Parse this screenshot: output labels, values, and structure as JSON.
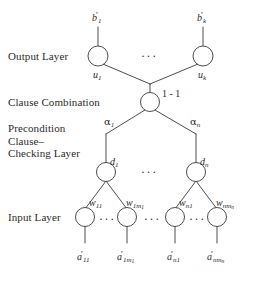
{
  "figure": {
    "type": "neural-network-architecture-diagram",
    "background_color": "#ffffff",
    "stroke_color": "#3a3a3a",
    "text_color": "#2b2b2b"
  },
  "layer_labels": {
    "output": "Output Layer",
    "clause_combination": "Clause Combination",
    "precondition": "Precondition\nClause–\nChecking Layer",
    "input": "Input Layer"
  },
  "output_layer": {
    "nodes": [
      {
        "id": "o1",
        "top_label": "b",
        "top_prime": "′",
        "top_sub": "1",
        "edge_label": "u",
        "edge_sub": "1"
      },
      {
        "id": "ok",
        "top_label": "b",
        "top_prime": "′",
        "top_sub": "k",
        "edge_label": "u",
        "edge_sub": "k"
      }
    ],
    "ellipsis": "···"
  },
  "combination_layer": {
    "node_label": "1 - 1",
    "edges": [
      {
        "label": "α",
        "sub": "1"
      },
      {
        "label": "α",
        "sub": "n"
      }
    ]
  },
  "precondition_layer": {
    "nodes": [
      {
        "id": "d1",
        "label": "d",
        "sub": "1"
      },
      {
        "id": "dn",
        "label": "d",
        "sub": "n"
      }
    ],
    "ellipsis": "···"
  },
  "input_layer": {
    "weights": [
      {
        "label": "w",
        "sub": "11",
        "sub2": ""
      },
      {
        "label": "w",
        "sub": "1m",
        "sub2": "1"
      },
      {
        "label": "w",
        "sub": "n1",
        "sub2": ""
      },
      {
        "label": "w",
        "sub": "nm",
        "sub2": "n"
      }
    ],
    "inputs": [
      {
        "label": "a",
        "prime": "′",
        "sub": "11",
        "sub2": ""
      },
      {
        "label": "a",
        "prime": "′",
        "sub": "1m",
        "sub2": "1"
      },
      {
        "label": "a",
        "prime": "′",
        "sub": "n1",
        "sub2": ""
      },
      {
        "label": "a",
        "prime": "′",
        "sub": "nm",
        "sub2": "n"
      }
    ],
    "group_ellipsis": "···",
    "middle_ellipsis": "···"
  }
}
